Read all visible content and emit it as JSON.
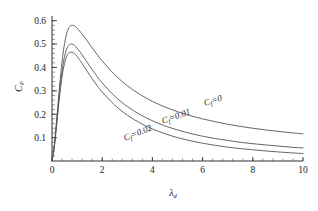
{
  "chart_data": {
    "type": "line",
    "title": "",
    "xlabel": "λ",
    "xlabel_sub": "d",
    "ylabel": "C",
    "ylabel_sub": "P",
    "xlim": [
      0,
      10
    ],
    "ylim": [
      0,
      0.62
    ],
    "xticks": [
      0,
      2,
      4,
      6,
      8,
      10
    ],
    "xtick_labels": [
      "0",
      "2",
      "4",
      "6",
      "8",
      "10"
    ],
    "yticks": [
      0.1,
      0.2,
      0.3,
      0.4,
      0.5,
      0.6
    ],
    "ytick_labels": [
      "0.1",
      "0.2",
      "0.3",
      "0.4",
      "0.5",
      "0.6"
    ],
    "x_minor_step": 0.4,
    "y_minor_step": 0.02,
    "grid": false,
    "legend_position": "inline-annotations",
    "line_color": "#555555",
    "axis_color": "#333333",
    "background": "#ffffff",
    "series": [
      {
        "name": "C_f = 0",
        "label": "C",
        "label_sub": "f",
        "label_value": "=0",
        "annotation": "C_f=0",
        "x": [
          0,
          0.1,
          0.2,
          0.3,
          0.4,
          0.5,
          0.6,
          0.7,
          0.8,
          0.9,
          1.0,
          1.2,
          1.4,
          1.6,
          1.8,
          2.0,
          2.5,
          3.0,
          3.5,
          4.0,
          4.5,
          5.0,
          5.5,
          6.0,
          6.5,
          7.0,
          7.5,
          8.0,
          8.5,
          9.0,
          9.5,
          10.0
        ],
        "y": [
          0.0,
          0.075,
          0.195,
          0.318,
          0.424,
          0.502,
          0.551,
          0.574,
          0.58,
          0.577,
          0.568,
          0.543,
          0.514,
          0.484,
          0.455,
          0.428,
          0.369,
          0.322,
          0.285,
          0.255,
          0.231,
          0.211,
          0.194,
          0.18,
          0.168,
          0.157,
          0.148,
          0.14,
          0.133,
          0.127,
          0.121,
          0.116
        ]
      },
      {
        "name": "C_f = 0.01",
        "label": "C",
        "label_sub": "f",
        "label_value": "=0.01",
        "annotation": "C_f=0.01",
        "x": [
          0,
          0.1,
          0.2,
          0.3,
          0.4,
          0.5,
          0.6,
          0.7,
          0.8,
          0.9,
          1.0,
          1.2,
          1.4,
          1.6,
          1.8,
          2.0,
          2.5,
          3.0,
          3.5,
          4.0,
          4.5,
          5.0,
          5.5,
          6.0,
          6.5,
          7.0,
          7.5,
          8.0,
          8.5,
          9.0,
          9.5,
          10.0
        ],
        "y": [
          0.0,
          0.07,
          0.18,
          0.292,
          0.383,
          0.447,
          0.483,
          0.498,
          0.5,
          0.494,
          0.483,
          0.454,
          0.422,
          0.391,
          0.361,
          0.334,
          0.277,
          0.233,
          0.199,
          0.172,
          0.15,
          0.133,
          0.118,
          0.106,
          0.096,
          0.088,
          0.08,
          0.074,
          0.069,
          0.064,
          0.059,
          0.056
        ]
      },
      {
        "name": "C_f = 0.02",
        "label": "C",
        "label_sub": "f",
        "label_value": "=0.02",
        "annotation": "C_f=0.02",
        "x": [
          0,
          0.1,
          0.2,
          0.3,
          0.4,
          0.5,
          0.6,
          0.7,
          0.8,
          0.9,
          1.0,
          1.2,
          1.4,
          1.6,
          1.8,
          2.0,
          2.5,
          3.0,
          3.5,
          4.0,
          4.5,
          5.0,
          5.5,
          6.0,
          6.5,
          7.0,
          7.5,
          8.0,
          8.5,
          9.0,
          9.5,
          10.0
        ],
        "y": [
          0.0,
          0.066,
          0.17,
          0.275,
          0.359,
          0.418,
          0.451,
          0.464,
          0.465,
          0.459,
          0.447,
          0.417,
          0.384,
          0.352,
          0.322,
          0.295,
          0.239,
          0.196,
          0.163,
          0.137,
          0.117,
          0.1,
          0.087,
          0.076,
          0.067,
          0.059,
          0.053,
          0.048,
          0.043,
          0.039,
          0.035,
          0.032
        ]
      }
    ]
  },
  "annotations": [
    {
      "id": "label-cf-0",
      "text_main": "C",
      "text_sub": "f",
      "text_tail": "=0",
      "x": 205,
      "y": 106,
      "rotate": -18
    },
    {
      "id": "label-cf-001",
      "text_main": "C",
      "text_sub": "f",
      "text_tail": "=0.01",
      "x": 163,
      "y": 124,
      "rotate": -20
    },
    {
      "id": "label-cf-002",
      "text_main": "C",
      "text_sub": "f",
      "text_tail": "=0.02",
      "x": 125,
      "y": 141,
      "rotate": -22
    }
  ]
}
